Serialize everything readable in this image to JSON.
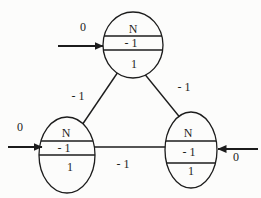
{
  "figure": {
    "background": "#fcfcfb",
    "ink": "#1c1c1c",
    "nodes": {
      "top": {
        "rows": [
          "N",
          "- 1",
          "1"
        ]
      },
      "left": {
        "rows": [
          "N",
          "- 1",
          "1"
        ]
      },
      "right": {
        "rows": [
          "N",
          "- 1",
          "1"
        ]
      }
    },
    "edges": {
      "top_left": {
        "label": "- 1"
      },
      "top_right": {
        "label": "- 1"
      },
      "bottom": {
        "label": "- 1"
      }
    },
    "inputs": {
      "top": {
        "label": "0"
      },
      "left": {
        "label": "0"
      },
      "right": {
        "label": "0"
      }
    }
  }
}
